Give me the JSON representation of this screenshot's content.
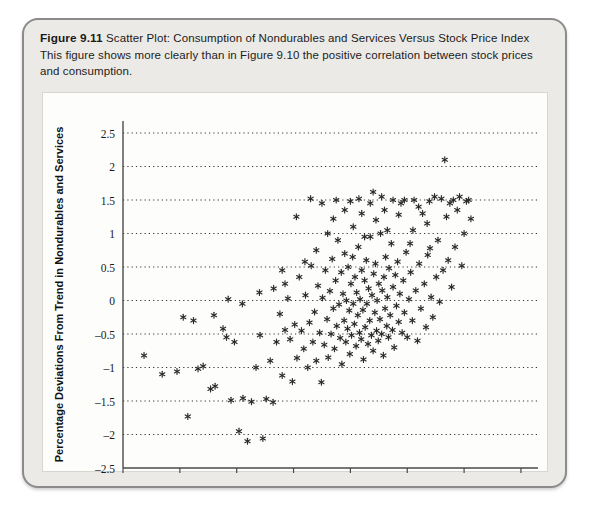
{
  "figure": {
    "number_label": "Figure 9.11",
    "title": "Scatter Plot: Consumption of Nondurables and Services Versus Stock Price Index",
    "description": "This figure shows more clearly than in Figure 9.10 the positive correlation between stock prices and consumption."
  },
  "colors": {
    "frame_border": "#8b8b8b",
    "frame_background": "#eceae7",
    "plot_background": "#fdfdfb",
    "axis": "#4a4a4a",
    "gridline": "#333333",
    "marker": "#2b2b2b",
    "text": "#1a1a1a"
  },
  "chart_data": {
    "type": "scatter",
    "title": "Scatter Plot: Consumption of Nondurables and Services Versus Stock Price Index",
    "xlabel": "Percentage Deviations From Trend in Stock Price Index",
    "ylabel": "Percentage Deviations From Trend in Nondurables and Services",
    "xlim": [
      -40,
      33
    ],
    "ylim": [
      -2.5,
      2.5
    ],
    "xticks": [
      -40,
      -30,
      -20,
      -10,
      0,
      10,
      20,
      30
    ],
    "xtick_labels": [
      "–40",
      "–30",
      "–20",
      "–10",
      "0",
      "10",
      "20",
      "30"
    ],
    "yticks": [
      -2.5,
      -2,
      -1.5,
      -1,
      -0.5,
      0,
      0.5,
      1,
      1.5,
      2,
      2.5
    ],
    "ytick_labels": [
      "–2.5",
      "–2",
      "–1.5",
      "–1",
      "–0.5",
      "0",
      "0.5",
      "1",
      "1.5",
      "2",
      "2.5"
    ],
    "grid": "horizontal-dotted",
    "legend": null,
    "marker_style": "asterisk",
    "point_count": 196,
    "points": [
      [
        -36.3,
        -0.82
      ],
      [
        -33.1,
        -1.1
      ],
      [
        -30.5,
        -1.06
      ],
      [
        -29.4,
        -0.25
      ],
      [
        -28.6,
        -1.73
      ],
      [
        -27.6,
        -0.3
      ],
      [
        -26.8,
        -1.02
      ],
      [
        -25.9,
        -0.98
      ],
      [
        -24.6,
        -1.32
      ],
      [
        -23.8,
        -1.28
      ],
      [
        -22.4,
        -0.42
      ],
      [
        -21.8,
        -0.55
      ],
      [
        -21.0,
        -1.49
      ],
      [
        -20.4,
        -0.62
      ],
      [
        -19.6,
        -1.95
      ],
      [
        -18.9,
        -1.46
      ],
      [
        -18.1,
        -2.1
      ],
      [
        -17.4,
        -1.51
      ],
      [
        -16.6,
        -1.0
      ],
      [
        -15.9,
        -0.52
      ],
      [
        -15.4,
        -2.06
      ],
      [
        -14.8,
        -1.47
      ],
      [
        -14.1,
        -0.9
      ],
      [
        -13.6,
        -1.52
      ],
      [
        -13.0,
        -0.62
      ],
      [
        -12.4,
        -0.2
      ],
      [
        -12.0,
        -1.12
      ],
      [
        -11.5,
        -0.44
      ],
      [
        -11.0,
        0.03
      ],
      [
        -10.6,
        -0.58
      ],
      [
        -10.2,
        -1.21
      ],
      [
        -9.8,
        -0.36
      ],
      [
        -9.4,
        -0.86
      ],
      [
        -9.0,
        0.35
      ],
      [
        -8.6,
        -0.45
      ],
      [
        -8.2,
        -0.72
      ],
      [
        -7.9,
        0.08
      ],
      [
        -7.5,
        -1.0
      ],
      [
        -7.2,
        -0.33
      ],
      [
        -6.9,
        0.52
      ],
      [
        -6.6,
        -0.62
      ],
      [
        -6.3,
        -0.17
      ],
      [
        -6.0,
        -0.9
      ],
      [
        -5.7,
        0.22
      ],
      [
        -5.4,
        -0.48
      ],
      [
        -5.1,
        -1.22
      ],
      [
        -4.9,
        0.04
      ],
      [
        -4.6,
        -0.66
      ],
      [
        -4.4,
        0.45
      ],
      [
        -4.1,
        -0.28
      ],
      [
        -3.9,
        -0.85
      ],
      [
        -3.6,
        0.14
      ],
      [
        -3.4,
        -0.5
      ],
      [
        -3.2,
        0.62
      ],
      [
        -3.0,
        -0.12
      ],
      [
        -2.8,
        -0.72
      ],
      [
        -2.6,
        0.3
      ],
      [
        -2.4,
        -0.38
      ],
      [
        -2.2,
        0.9
      ],
      [
        -2.0,
        -0.06
      ],
      [
        -1.8,
        -0.56
      ],
      [
        -1.6,
        0.42
      ],
      [
        -1.5,
        -0.95
      ],
      [
        -1.3,
        0.1
      ],
      [
        -1.1,
        -0.3
      ],
      [
        -1.0,
        0.7
      ],
      [
        -0.8,
        -0.62
      ],
      [
        -0.7,
        0.0
      ],
      [
        -0.5,
        -0.42
      ],
      [
        -0.4,
        0.5
      ],
      [
        -0.2,
        -0.15
      ],
      [
        -0.1,
        -0.8
      ],
      [
        0.1,
        0.25
      ],
      [
        0.2,
        -0.52
      ],
      [
        0.4,
        0.65
      ],
      [
        0.5,
        -0.05
      ],
      [
        0.7,
        -0.35
      ],
      [
        0.8,
        0.35
      ],
      [
        1.0,
        -0.68
      ],
      [
        1.1,
        0.12
      ],
      [
        1.3,
        -0.22
      ],
      [
        1.4,
        0.8
      ],
      [
        1.6,
        -0.48
      ],
      [
        1.7,
        0.02
      ],
      [
        1.9,
        -0.58
      ],
      [
        2.0,
        0.45
      ],
      [
        2.2,
        -0.14
      ],
      [
        2.3,
        -0.88
      ],
      [
        2.5,
        0.3
      ],
      [
        2.6,
        -0.4
      ],
      [
        2.8,
        0.6
      ],
      [
        2.9,
        -0.05
      ],
      [
        3.1,
        -0.65
      ],
      [
        3.2,
        0.18
      ],
      [
        3.4,
        -0.3
      ],
      [
        3.5,
        0.95
      ],
      [
        3.7,
        -0.52
      ],
      [
        3.8,
        0.08
      ],
      [
        4.0,
        -0.75
      ],
      [
        4.1,
        0.4
      ],
      [
        4.3,
        -0.18
      ],
      [
        4.4,
        0.55
      ],
      [
        4.6,
        -0.45
      ],
      [
        4.7,
        0.0
      ],
      [
        4.9,
        -0.6
      ],
      [
        5.0,
        0.25
      ],
      [
        5.2,
        -0.28
      ],
      [
        5.3,
        1.0
      ],
      [
        5.5,
        -0.5
      ],
      [
        5.6,
        0.15
      ],
      [
        5.8,
        -0.82
      ],
      [
        5.9,
        0.35
      ],
      [
        6.1,
        -0.12
      ],
      [
        6.2,
        0.65
      ],
      [
        6.4,
        -0.38
      ],
      [
        6.5,
        0.05
      ],
      [
        6.7,
        -0.55
      ],
      [
        6.8,
        0.48
      ],
      [
        7.0,
        -0.22
      ],
      [
        7.2,
        0.85
      ],
      [
        7.4,
        -0.44
      ],
      [
        7.5,
        0.2
      ],
      [
        7.7,
        -0.7
      ],
      [
        7.9,
        0.38
      ],
      [
        8.1,
        -0.08
      ],
      [
        8.3,
        0.58
      ],
      [
        8.5,
        -0.32
      ],
      [
        8.7,
        0.1
      ],
      [
        8.9,
        1.45
      ],
      [
        9.1,
        -0.48
      ],
      [
        9.3,
        0.3
      ],
      [
        9.5,
        -0.18
      ],
      [
        9.8,
        0.72
      ],
      [
        10.0,
        -0.55
      ],
      [
        10.3,
        0.02
      ],
      [
        10.6,
        0.42
      ],
      [
        10.9,
        -0.3
      ],
      [
        11.2,
        1.5
      ],
      [
        11.5,
        0.15
      ],
      [
        11.8,
        -0.6
      ],
      [
        12.1,
        0.55
      ],
      [
        12.4,
        -0.12
      ],
      [
        12.7,
        1.3
      ],
      [
        13.0,
        0.25
      ],
      [
        13.3,
        -0.4
      ],
      [
        13.6,
        0.68
      ],
      [
        13.9,
        1.48
      ],
      [
        14.2,
        0.05
      ],
      [
        14.5,
        -0.25
      ],
      [
        14.8,
        1.55
      ],
      [
        15.1,
        0.35
      ],
      [
        15.4,
        0.9
      ],
      [
        15.7,
        -0.02
      ],
      [
        16.0,
        1.52
      ],
      [
        16.3,
        0.45
      ],
      [
        16.6,
        2.1
      ],
      [
        16.9,
        1.25
      ],
      [
        17.2,
        0.6
      ],
      [
        17.5,
        1.45
      ],
      [
        17.8,
        0.2
      ],
      [
        18.1,
        1.5
      ],
      [
        18.4,
        0.8
      ],
      [
        18.8,
        1.35
      ],
      [
        19.2,
        1.55
      ],
      [
        19.6,
        0.52
      ],
      [
        20.0,
        1.0
      ],
      [
        20.4,
        1.48
      ],
      [
        20.8,
        1.5
      ],
      [
        21.2,
        1.22
      ],
      [
        -2.5,
        1.5
      ],
      [
        -1.0,
        1.35
      ],
      [
        0.5,
        1.1
      ],
      [
        1.5,
        1.52
      ],
      [
        2.5,
        0.95
      ],
      [
        3.5,
        1.45
      ],
      [
        4.5,
        1.2
      ],
      [
        5.5,
        1.55
      ],
      [
        6.5,
        1.05
      ],
      [
        7.5,
        1.5
      ],
      [
        -4.0,
        1.0
      ],
      [
        -5.0,
        1.45
      ],
      [
        -6.0,
        0.75
      ],
      [
        -8.0,
        0.58
      ],
      [
        -11.5,
        0.25
      ],
      [
        -13.5,
        0.18
      ],
      [
        -16.0,
        0.12
      ],
      [
        -19.0,
        -0.05
      ],
      [
        -21.5,
        0.02
      ],
      [
        -24.0,
        -0.22
      ],
      [
        8.5,
        1.28
      ],
      [
        9.5,
        1.5
      ],
      [
        10.5,
        0.85
      ],
      [
        12.0,
        1.4
      ],
      [
        13.5,
        1.15
      ],
      [
        -7.0,
        1.52
      ],
      [
        -9.5,
        1.25
      ],
      [
        0.0,
        1.48
      ],
      [
        4.0,
        1.62
      ],
      [
        -3.0,
        1.22
      ],
      [
        6.0,
        1.35
      ],
      [
        11.0,
        1.05
      ],
      [
        14.0,
        0.78
      ],
      [
        -12.0,
        0.45
      ],
      [
        2.0,
        1.3
      ]
    ]
  }
}
